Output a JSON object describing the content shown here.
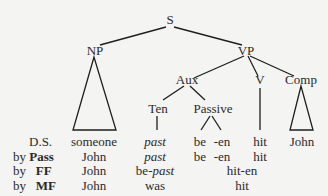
{
  "tree": {
    "nodes": {
      "S": "S",
      "NP": "NP",
      "VP": "VP",
      "Aux": "Aux",
      "V": "V",
      "Comp": "Comp",
      "Ten": "Ten",
      "Passive": "Passive"
    },
    "edges": [
      [
        "S",
        "NP"
      ],
      [
        "S",
        "VP"
      ],
      [
        "VP",
        "Aux"
      ],
      [
        "VP",
        "V"
      ],
      [
        "VP",
        "Comp"
      ],
      [
        "Aux",
        "Ten"
      ],
      [
        "Aux",
        "Passive"
      ],
      [
        "Ten",
        "past"
      ],
      [
        "Passive",
        "be"
      ],
      [
        "Passive",
        "-en"
      ],
      [
        "V",
        "hit"
      ]
    ],
    "triangles": [
      "NP",
      "Comp"
    ]
  },
  "rows": [
    {
      "label_prefix": "",
      "label_bold": "",
      "label": "D.S.",
      "np": "someone",
      "ten": "past",
      "be": "be",
      "en": "-en",
      "v": "hit",
      "comp": "John"
    },
    {
      "label_prefix": "by",
      "label_bold": "Pass",
      "np": "John",
      "ten": "past",
      "be": "be",
      "en": "-en",
      "v": "hit"
    },
    {
      "label_prefix": "by",
      "label_bold": "FF",
      "np": "John",
      "ten_prefix": "be-",
      "ten_italic": "past",
      "verb_group": "hit-en"
    },
    {
      "label_prefix": "by",
      "label_bold": "MF",
      "np": "John",
      "ten": "was",
      "verb_group": "hit"
    }
  ]
}
